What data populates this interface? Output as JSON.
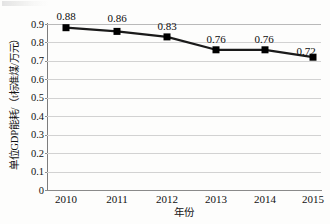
{
  "chart_data": {
    "type": "line",
    "title": "",
    "subtitle": "",
    "xlabel": "年份",
    "ylabel": "单位GDP能耗/（t标准煤/万元）",
    "categories": [
      "2010",
      "2011",
      "2012",
      "2013",
      "2014",
      "2015"
    ],
    "values": [
      0.88,
      0.86,
      0.83,
      0.76,
      0.76,
      0.72
    ],
    "point_labels": [
      "0.88",
      "0.86",
      "0.83",
      "0.76",
      "0.76",
      "0.72"
    ],
    "series": [
      {
        "name": "单位GDP能耗",
        "values": [
          0.88,
          0.86,
          0.83,
          0.76,
          0.76,
          0.72
        ]
      }
    ],
    "ylim": [
      0,
      0.9
    ],
    "y_ticks": [
      0.9,
      0.8,
      0.7,
      0.6,
      0.5,
      0.4,
      0.3,
      0.2,
      0.1,
      0
    ],
    "y_tick_labels": [
      "0.9",
      "0.8",
      "0.7",
      "0.6",
      "0.5",
      "0.4",
      "0.3",
      "0.2",
      "0.1",
      "0"
    ],
    "grid": "horizontal",
    "legend": "none",
    "marker": "square",
    "colors": {
      "line": "#1a1a1a",
      "marker": "#000000",
      "gridline": "#d2d2d2",
      "axis": "#808080",
      "background": "#fdfdfc",
      "text": "#111111"
    }
  }
}
